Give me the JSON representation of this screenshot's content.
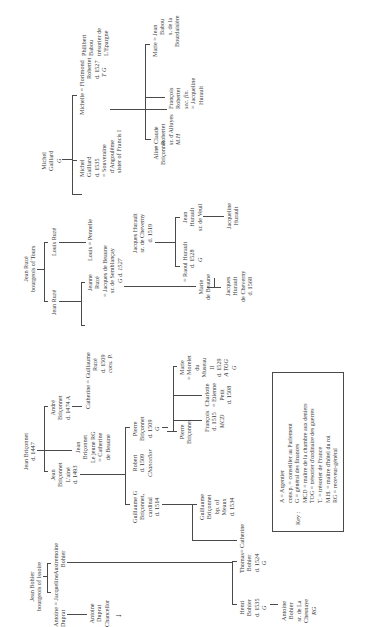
{
  "diagram": {
    "type": "genealogical-tree",
    "orientation": "rotated-90-ccw",
    "nodes": {
      "jean_bohier": [
        "Jean Bohier",
        "bourgeois of Issoire"
      ],
      "antoine_duprat": [
        "Antoine = Jacqueline",
        "Duprat"
      ],
      "austremoine_bohier": [
        "Austremoine",
        "Bohier"
      ],
      "antoine_duprat_chancellor": [
        "Antoine",
        "Duprat",
        "Chancellor"
      ],
      "henri_bohier": [
        "Henri",
        "Bohier",
        "d. 1535",
        "G"
      ],
      "thomas_bohier": [
        "Thomas",
        "Bohier",
        "d. 1524",
        "G"
      ],
      "catherine_briconnet_wife": [
        "= Catherine"
      ],
      "antoine_bohier_chesnaye": [
        "Antoine",
        "Bohier",
        "sr. de La",
        "Chesnaye",
        "RG"
      ],
      "jean_briconnet": [
        "Jean Briçonnet",
        "d. 1447"
      ],
      "jean_briconnet_aine": [
        "Jean",
        "Briçonnet",
        "L'ainé",
        "d. 1493"
      ],
      "jean_briconnet_jeune": [
        "Jean",
        "Briçonnet",
        "Le jeune RG",
        "= Catherine",
        "de Beaune"
      ],
      "andre_briconnet": [
        "André",
        "Briçonnet",
        "d. 1474 A"
      ],
      "guillaume_briconnet_cardinal": [
        "Guillaume G",
        "Briçonnet,",
        "cardinal",
        "d. 1514"
      ],
      "robert_briconnet": [
        "Robert",
        "d. 1509",
        "Chancellor"
      ],
      "pierre_briconnet_g": [
        "Pierre",
        "Briçonnet",
        "d. 1509",
        "G"
      ],
      "guillaume_briconnet_meaux": [
        "Guillaume",
        "Briçonnet",
        "bp. of",
        "Meaux",
        "d. 1534"
      ],
      "catherine_briconnet": [
        "Catherine = Guillaume",
        "Ruzé",
        "d. 1509",
        "cons. P."
      ],
      "pierre_briconnet_son": [
        "Pierre",
        "Briçonnet"
      ],
      "marie_briconnet": [
        "Marie",
        "= Morelet",
        "du",
        "Museau",
        "II",
        "d. 1529",
        "A TOG",
        "G"
      ],
      "francois_briconnet": [
        "François",
        "d. 1515",
        "MCD"
      ],
      "charlotte_briconnet": [
        "Charlotte",
        "= Etienne",
        "Petit",
        "d. 1508"
      ],
      "jean_ruze": [
        "Jean Ruzé",
        "bourgeois of Tours"
      ],
      "jean_ruze_son": [
        "Jean Ruzé"
      ],
      "louis_ruze": [
        "Louis Ruzé"
      ],
      "jeanne_ruze": [
        "Jeanne",
        "Ruzé",
        "= Jacques de Beaune",
        "sr. de Semblançay",
        "G d. 1527"
      ],
      "louis_pennelle": [
        "Louis = Pennelle"
      ],
      "jacques_hurault": [
        "Jacques Hurault",
        "sr. de Cheverny",
        "d. 1519"
      ],
      "marie_de_beaune": [
        "Marie",
        "de Beaune"
      ],
      "raoul_hurault": [
        "= Raoul Hurault",
        "d. 1528",
        "G"
      ],
      "jean_hurault": [
        "Jean",
        "Hurault",
        "sr. de Veuil"
      ],
      "jacques_hurault_cheverny": [
        "Jacques",
        "Hurault",
        "de Cheverny",
        "d. 1568"
      ],
      "jacqueline_hurault": [
        "Jacqueline",
        "Hurault"
      ],
      "michel_gaillard": [
        "Michel",
        "Gaillard",
        "G"
      ],
      "michel_gaillard_son": [
        "Michel",
        "Gaillard",
        "d. 1535",
        "= Souveraine",
        "d'Angoulême",
        "sister of Francis I"
      ],
      "michelle_florimond": [
        "Michelle = Florimond",
        "Robertet",
        "d. 1527",
        "T G"
      ],
      "aline_briconnet": [
        "Aline",
        "Briçonnet"
      ],
      "claude_robertet": [
        "= Claude",
        "Robertet",
        "sr. d'Alluyes",
        "M.H"
      ],
      "francois_robertet": [
        "François",
        "Robertet",
        "sec. fin.",
        "= Jacqueline",
        "Hurault"
      ],
      "marie_jean_babou": [
        "Marie = Jean",
        "Babou",
        "s. de la",
        "Bourdaisière"
      ],
      "philibert_babou": [
        "Philibert",
        "Babou",
        "trésorier de",
        "L'Epargne"
      ]
    },
    "key": {
      "label": "Key :",
      "entries": [
        "A = Argentier",
        "cons.p. = conseiller au Parlement",
        "G = général des finances",
        "MCD = maître de la chambre aux deniers",
        "TOG = trésorier d'ordinaire des guerres",
        "T. = trésorier de France",
        "M.H. = maître d'hôtel du roi",
        "RG = receveur-général"
      ]
    }
  }
}
